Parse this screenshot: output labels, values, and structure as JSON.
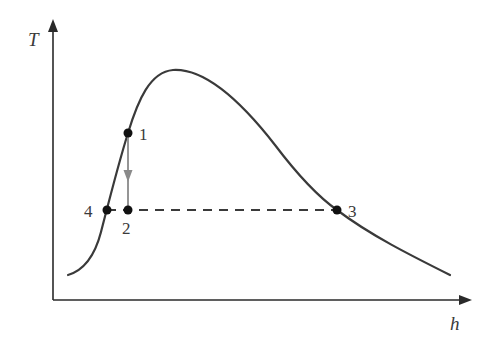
{
  "diagram": {
    "type": "T-h state diagram (refrigeration / vapor dome)",
    "axes": {
      "y_label": "T",
      "x_label": "h"
    },
    "points": [
      {
        "id": "1",
        "label": "1",
        "x": 128,
        "y": 133
      },
      {
        "id": "2",
        "label": "2",
        "x": 128,
        "y": 210
      },
      {
        "id": "3",
        "label": "3",
        "x": 337,
        "y": 210
      },
      {
        "id": "4",
        "label": "4",
        "x": 107,
        "y": 210
      }
    ],
    "processes": [
      {
        "from": "1",
        "to": "2",
        "style": "solid-gray-arrow"
      },
      {
        "from": "4",
        "to": "3",
        "style": "dashed"
      }
    ],
    "colors": {
      "curve": "#3a3a3a",
      "axis": "#2a2a2a",
      "process_arrow": "#8a8a8a",
      "point": "#111111"
    }
  }
}
